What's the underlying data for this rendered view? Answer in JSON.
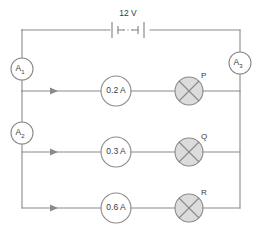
{
  "diagram": {
    "type": "parallel-circuit-schematic",
    "source": {
      "label": "12 V",
      "symbol": "battery-two-cell"
    },
    "meters": [
      {
        "id": "A1",
        "base": "A",
        "subscript": "1",
        "position": "left-rail-upper"
      },
      {
        "id": "A2",
        "base": "A",
        "subscript": "2",
        "position": "left-rail-middle"
      },
      {
        "id": "A3",
        "base": "A",
        "subscript": "3",
        "position": "right-rail-upper"
      }
    ],
    "branches": [
      {
        "reading": "0.2 A",
        "lamp": "P"
      },
      {
        "reading": "0.3 A",
        "lamp": "Q"
      },
      {
        "reading": "0.6 A",
        "lamp": "R"
      }
    ],
    "current_arrows": 3,
    "colors": {
      "wire": "#8a8a8a",
      "lamp_fill": "#dcdcdc",
      "text": "#3a3a3a",
      "background": "#ffffff"
    }
  }
}
